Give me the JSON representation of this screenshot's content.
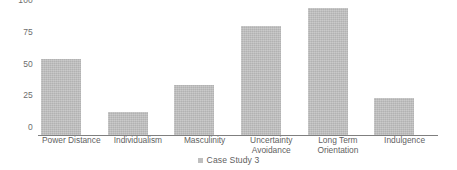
{
  "chart_data": {
    "type": "bar",
    "title": "",
    "subtitle": "",
    "xlabel": "",
    "ylabel": "",
    "categories": [
      "Power Distance",
      "Individualism",
      "Masculinity",
      "Uncertainty\nAvoidance",
      "Long Term\nOrientation",
      "Indulgence"
    ],
    "values": [
      60,
      18,
      39,
      86,
      100,
      29
    ],
    "series": [
      {
        "name": "Case Study 3",
        "values": [
          60,
          18,
          39,
          86,
          100,
          29
        ]
      }
    ],
    "ylim": [
      0,
      100
    ],
    "y_ticks": [
      0,
      25,
      50,
      75,
      100
    ],
    "y_tick_labels": [
      "0",
      "25",
      "50",
      "75",
      "100"
    ],
    "grid": false,
    "legend": {
      "position": "bottom",
      "entries": [
        {
          "label": "Case Study 3",
          "color": "#bfbfbf",
          "marker": "square-swatch"
        }
      ]
    },
    "colors": {
      "bar_fill": "#bfbfbf",
      "axis_line": "#7f7f7f",
      "tick_text": "#6d6d6d",
      "label_text": "#5f5f5f",
      "background": "#ffffff"
    }
  }
}
